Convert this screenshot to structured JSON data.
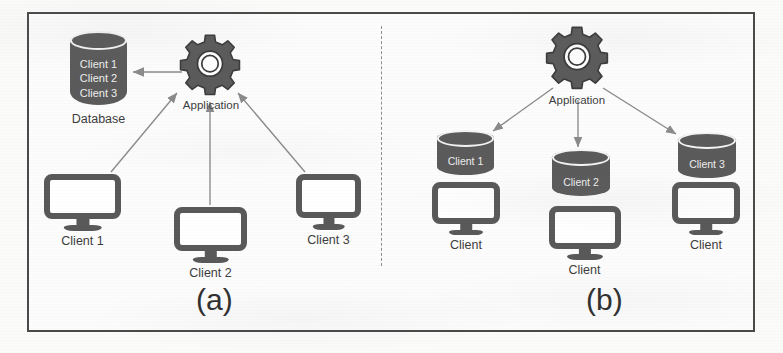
{
  "figure": {
    "panels": [
      {
        "id": "a",
        "letter": "(a)",
        "description": "Single shared database holding all client records, accessed through one application",
        "database": {
          "caption": "Database",
          "records": [
            "Client 1",
            "Client 2",
            "Client 3"
          ]
        },
        "application": {
          "label": "Application",
          "icon": "gear-icon"
        },
        "clients": [
          {
            "label": "Client 1",
            "icon": "monitor-icon"
          },
          {
            "label": "Client 2",
            "icon": "monitor-icon"
          },
          {
            "label": "Client 3",
            "icon": "monitor-icon"
          }
        ]
      },
      {
        "id": "b",
        "letter": "(b)",
        "description": "One application writing to a separate database per client",
        "application": {
          "label": "Application",
          "icon": "gear-icon"
        },
        "databases": [
          {
            "label": "Client 1"
          },
          {
            "label": "Client 2"
          },
          {
            "label": "Client 3"
          }
        ],
        "clients": [
          {
            "label": "Client",
            "icon": "monitor-icon"
          },
          {
            "label": "Client",
            "icon": "monitor-icon"
          },
          {
            "label": "Client",
            "icon": "monitor-icon"
          }
        ]
      }
    ]
  },
  "colors": {
    "shape_fill": "#5b5b5b",
    "icon_stroke": "#595959",
    "frame_border": "#4a4a4a",
    "divider": "#8d8d8d",
    "connector": "#8a8a8a",
    "text_dark": "#3d3d3d",
    "text_on_shape": "#eeeeee",
    "background": "#fbfbfa"
  }
}
